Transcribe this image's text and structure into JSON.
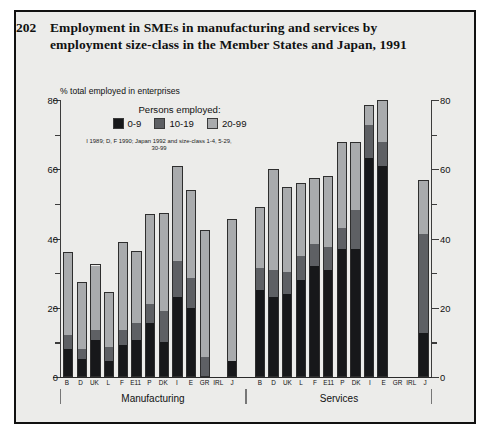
{
  "title": {
    "number": "202",
    "text": "Employment in SMEs in manufacturing and services by employment size-class in the Member States and Japan, 1991"
  },
  "axis_caption": "% total employed in enterprises",
  "legend": {
    "heading": "Persons employed:",
    "items": [
      {
        "label": "0-9",
        "color": "#17181a"
      },
      {
        "label": "10-19",
        "color": "#5e6064"
      },
      {
        "label": "20-99",
        "color": "#a9abad"
      }
    ]
  },
  "footnote": "I 1989; D, F 1990; Japan 1992 and size-class 1-4, 5-29, 30-99",
  "group_labels": [
    "Manufacturing",
    "Services"
  ],
  "chart_data": {
    "type": "bar",
    "subtype": "stacked",
    "title": "Employment in SMEs in manufacturing and services by employment size-class in the Member States and Japan, 1991",
    "xlabel": "",
    "ylabel": "% total employed in enterprises",
    "ylim": [
      0,
      80
    ],
    "yticks": [
      0,
      20,
      40,
      60,
      80
    ],
    "yminor_step": 10,
    "grid": false,
    "legend_position": "top-left",
    "series": [
      {
        "name": "0-9",
        "color": "#17181a"
      },
      {
        "name": "10-19",
        "color": "#5e6064"
      },
      {
        "name": "20-99",
        "color": "#a9abad"
      }
    ],
    "groups": [
      {
        "name": "Manufacturing",
        "categories": [
          "B",
          "D",
          "UK",
          "L",
          "F",
          "E11",
          "P",
          "DK",
          "I",
          "E",
          "GR",
          "IRL",
          "J"
        ],
        "values": {
          "0-9": [
            8.0,
            5.0,
            10.5,
            4.5,
            9.0,
            10.5,
            15.5,
            10.0,
            23.0,
            20.0,
            0.0,
            null,
            4.5
          ],
          "10-19": [
            4.0,
            3.0,
            3.0,
            4.0,
            4.5,
            5.0,
            5.5,
            9.0,
            10.5,
            8.5,
            5.5,
            null,
            0.0
          ],
          "20-99": [
            24.0,
            19.5,
            19.0,
            16.0,
            25.5,
            21.0,
            26.0,
            28.5,
            27.5,
            25.5,
            37.0,
            null,
            41.0
          ]
        },
        "totals": [
          36.0,
          27.5,
          32.5,
          24.5,
          39.0,
          36.5,
          47.0,
          47.5,
          61.0,
          54.0,
          42.5,
          null,
          45.5
        ]
      },
      {
        "name": "Services",
        "categories": [
          "B",
          "D",
          "UK",
          "L",
          "F",
          "E11",
          "P",
          "DK",
          "I",
          "E",
          "GR",
          "IRL",
          "J"
        ],
        "values": {
          "0-9": [
            25.0,
            23.0,
            24.0,
            28.0,
            32.0,
            31.0,
            37.0,
            37.0,
            63.5,
            61.0,
            0.0,
            null,
            12.5
          ],
          "10-19": [
            6.5,
            8.0,
            6.5,
            7.0,
            6.5,
            6.5,
            6.0,
            11.5,
            9.5,
            7.0,
            0.0,
            null,
            29.0
          ],
          "20-99": [
            17.5,
            29.0,
            24.5,
            21.0,
            19.0,
            20.5,
            25.0,
            19.5,
            5.5,
            12.0,
            0.0,
            null,
            15.5
          ]
        },
        "totals": [
          49.0,
          60.0,
          55.0,
          56.0,
          57.5,
          58.0,
          68.0,
          68.0,
          78.5,
          80.0,
          null,
          null,
          57.0
        ]
      }
    ]
  }
}
